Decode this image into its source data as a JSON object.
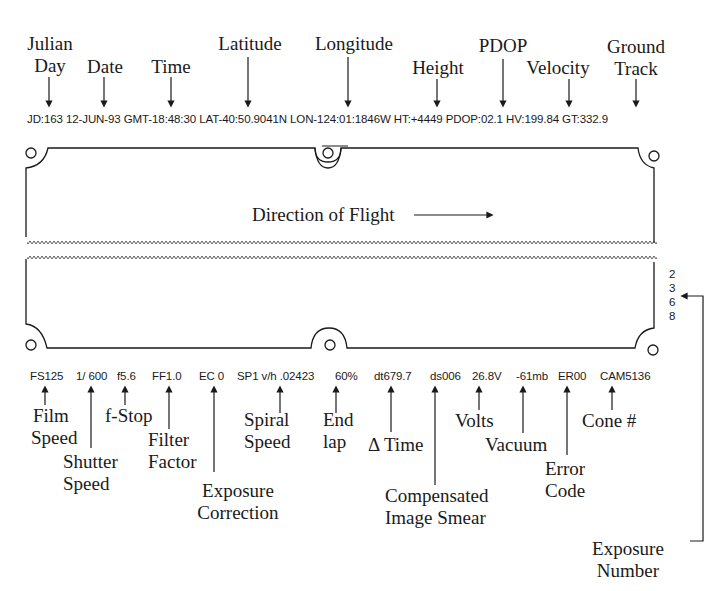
{
  "top_labels": [
    {
      "id": "julian-day",
      "lines": [
        "Julian",
        "Day"
      ],
      "value": "JD:163"
    },
    {
      "id": "date",
      "lines": [
        "Date"
      ],
      "value": "12-JUN-93"
    },
    {
      "id": "time",
      "lines": [
        "Time"
      ],
      "value": "GMT-18:48:30"
    },
    {
      "id": "latitude",
      "lines": [
        "Latitude"
      ],
      "value": "LAT-40:50.9041N"
    },
    {
      "id": "longitude",
      "lines": [
        "Longitude"
      ],
      "value": "LON-124:01:1846W"
    },
    {
      "id": "height",
      "lines": [
        "Height"
      ],
      "value": "HT:+4449"
    },
    {
      "id": "pdop",
      "lines": [
        "PDOP"
      ],
      "value": "PDOP:02.1"
    },
    {
      "id": "velocity",
      "lines": [
        "Velocity"
      ],
      "value": "HV:199.84"
    },
    {
      "id": "ground-track",
      "lines": [
        "Ground",
        "Track"
      ],
      "value": "GT:332.9"
    }
  ],
  "top_data_strip": "JD:163 12-JUN-93 GMT-18:48:30 LAT-40:50.9041N LON-124:01:1846W HT:+4449 PDOP:02.1 HV:199.84 GT:332.9",
  "film": {
    "direction_label": "Direction of Flight",
    "exposure_number_digits": [
      "2",
      "3",
      "6",
      "8"
    ]
  },
  "bottom_values": {
    "film_speed": "FS125",
    "shutter_speed": "1/ 600",
    "f_stop": "f5.6",
    "filter_factor": "FF1.0",
    "exposure_correction": "EC 0",
    "spiral_speed": "SP1 v/h .02423",
    "end_lap": "60%",
    "delta_time": "dt679.7",
    "image_smear": "ds006",
    "volts": "26.8V",
    "vacuum": "-61mb",
    "error_code": "ER00",
    "cone": "CAM5136"
  },
  "bottom_labels": {
    "film_speed": [
      "Film",
      "Speed"
    ],
    "shutter_speed": [
      "Shutter",
      "Speed"
    ],
    "f_stop": [
      "f-Stop"
    ],
    "filter_factor": [
      "Filter",
      "Factor"
    ],
    "exposure_correction": [
      "Exposure",
      "Correction"
    ],
    "spiral_speed": [
      "Spiral",
      "Speed"
    ],
    "end_lap": [
      "End",
      "lap"
    ],
    "delta_time": [
      "Δ Time"
    ],
    "image_smear": [
      "Compensated",
      "Image Smear"
    ],
    "volts": [
      "Volts"
    ],
    "vacuum": [
      "Vacuum"
    ],
    "error_code": [
      "Error",
      "Code"
    ],
    "cone": [
      "Cone #"
    ],
    "exposure_number": [
      "Exposure",
      "Number"
    ]
  }
}
